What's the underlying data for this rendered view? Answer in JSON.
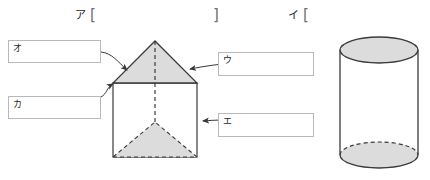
{
  "worksheet": {
    "groups": [
      {
        "key": "ア",
        "open_bracket": "[",
        "close_bracket": "]"
      },
      {
        "key": "イ",
        "open_bracket": "[",
        "close_bracket": ""
      }
    ],
    "answer_boxes": [
      {
        "key": "オ",
        "value": ""
      },
      {
        "key": "カ",
        "value": ""
      },
      {
        "key": "ウ",
        "value": ""
      },
      {
        "key": "エ",
        "value": ""
      }
    ],
    "figures": [
      {
        "name": "triangular-prism",
        "shading_color": "#dcdcdc",
        "stroke_color": "#3a3a3a"
      },
      {
        "name": "cylinder",
        "shading_color": "#dcdcdc",
        "stroke_color": "#3a3a3a"
      }
    ],
    "colors": {
      "stroke": "#3a3a3a",
      "shade": "#dcdcdc",
      "box_border": "#b9b9bd",
      "leader_line": "#4a4a4a",
      "bracket": "#6e6e73"
    }
  }
}
